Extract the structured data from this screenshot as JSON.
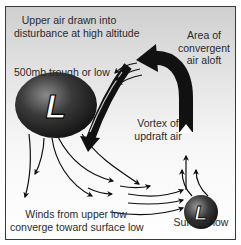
{
  "diagram": {
    "labels": {
      "upper_air": [
        "Upper air drawn into",
        "disturbance at high altitude"
      ],
      "trough": "500mb trough or low",
      "convergent": [
        "Area of",
        "convergent",
        "air aloft"
      ],
      "vortex": [
        "Vortex of",
        "updraft air"
      ],
      "winds": [
        "Winds from upper low",
        "converge toward surface low"
      ],
      "surface_low": "Surface low"
    },
    "symbols": {
      "upper_low_letter": "L",
      "surface_low_letter": "L"
    },
    "colors": {
      "frame_border": "#3a3a3a",
      "background_top": "#cfcfcf",
      "background_bottom": "#ffffff",
      "arrow": "#111111",
      "low_fill": "#2b2b2b",
      "text": "#2a2a2a"
    }
  }
}
